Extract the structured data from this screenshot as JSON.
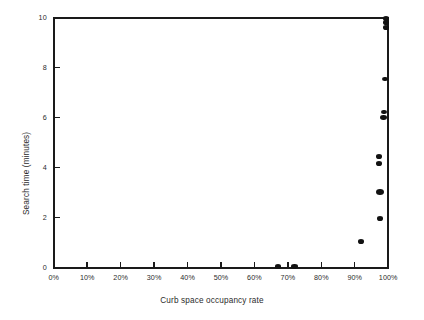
{
  "chart_data": {
    "type": "scatter",
    "title": "",
    "xlabel": "Curb space occupancy rate",
    "ylabel": "Search time (minutes)",
    "xlim": [
      0,
      100
    ],
    "ylim": [
      0,
      10
    ],
    "grid": false,
    "legend": null,
    "xticks": [
      0,
      10,
      20,
      30,
      40,
      50,
      60,
      70,
      80,
      90,
      100
    ],
    "xticklabels": [
      "0%",
      "10%",
      "20%",
      "30%",
      "40%",
      "50%",
      "60%",
      "70%",
      "80%",
      "90%",
      "100%"
    ],
    "yticks": [
      0,
      2,
      4,
      6,
      8,
      10
    ],
    "yticklabels": [
      "0",
      "2",
      "4",
      "6",
      "8",
      "10"
    ],
    "marker": "filled-circle",
    "marker_color": "#121212",
    "points": [
      {
        "x": 67.0,
        "y": 0.02,
        "r": 3.1
      },
      {
        "x": 72.0,
        "y": 0.02,
        "r": 3.1
      },
      {
        "x": 91.8,
        "y": 1.05,
        "r": 3.1
      },
      {
        "x": 97.5,
        "y": 1.95,
        "r": 3.0
      },
      {
        "x": 97.6,
        "y": 3.02,
        "r": 4.0
      },
      {
        "x": 97.2,
        "y": 4.17,
        "r": 3.0
      },
      {
        "x": 97.2,
        "y": 4.45,
        "r": 3.0
      },
      {
        "x": 98.6,
        "y": 6.02,
        "r": 3.2
      },
      {
        "x": 98.6,
        "y": 6.22,
        "r": 3.0
      },
      {
        "x": 99.0,
        "y": 7.55,
        "r": 3.1
      },
      {
        "x": 99.3,
        "y": 9.62,
        "r": 3.2
      },
      {
        "x": 99.3,
        "y": 9.8,
        "r": 3.2
      },
      {
        "x": 99.3,
        "y": 9.97,
        "r": 3.2
      }
    ]
  }
}
